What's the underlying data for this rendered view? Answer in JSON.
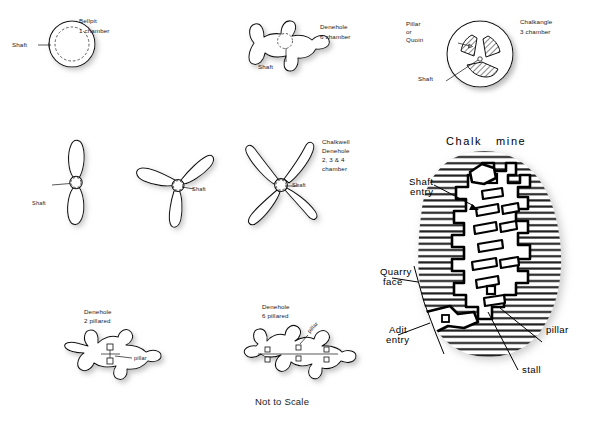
{
  "figure": {
    "caption": "Not to Scale",
    "diagrams": [
      {
        "id": "bellpit",
        "type": "bellpit",
        "title_line1": "Bellpit",
        "title_line2": "1 chamber",
        "labels": [
          "Shaft"
        ],
        "chambers": 1
      },
      {
        "id": "denehole-6-chamber",
        "type": "denehole",
        "title_line1": "Denehole",
        "title_line2": "6 chamber",
        "labels": [
          "Shaft"
        ],
        "chambers": 6
      },
      {
        "id": "chalkangle-3-chamber",
        "type": "chalkangle",
        "title_line1": "Chalkangle",
        "title_line2": "3 chamber",
        "labels": [
          "Pillar",
          "or",
          "Quoin",
          "Shaft"
        ],
        "pillar_label_line1": "Pillar",
        "pillar_label_line2": "or",
        "pillar_label_line3": "Quoin",
        "shaft_label": "Shaft",
        "chambers": 3
      },
      {
        "id": "chalkwell-2-chamber",
        "type": "chalkwell-denehole",
        "lobes": 2,
        "shaft_label": "Shaft"
      },
      {
        "id": "chalkwell-3-chamber",
        "type": "chalkwell-denehole",
        "lobes": 3,
        "shaft_label": "Shaft"
      },
      {
        "id": "chalkwell-4-chamber",
        "type": "chalkwell-denehole",
        "lobes": 4,
        "shaft_label": "Shaft",
        "title_line1": "Chalkwell",
        "title_line2": "Denehole",
        "title_line3": "2, 3 & 4",
        "title_line4": "chamber"
      },
      {
        "id": "denehole-2-pillared",
        "type": "denehole-pillared",
        "title_line1": "Denehole",
        "title_line2": "2 pillared",
        "pillar_label": "pillar",
        "pillars": 2
      },
      {
        "id": "denehole-6-pillared",
        "type": "denehole-pillared",
        "title_line1": "Denehole",
        "title_line2": "6 pillared",
        "pillar_label": "pillar",
        "pillars": 6
      }
    ],
    "chalk_mine": {
      "title": "Chalk   mine",
      "shaft_entry_line1": "Shaft",
      "shaft_entry_line2": "entry",
      "quarry_face_line1": "Quarry",
      "quarry_face_line2": "face",
      "adit_entry_line1": "Adit",
      "adit_entry_line2": "entry",
      "pillar_label": "pillar",
      "stall_label": "stall"
    }
  },
  "colors": {
    "ink": "#111111",
    "paper": "#ffffff",
    "hatch": "#1a1a1a",
    "shadow": "#d8d8d8"
  }
}
